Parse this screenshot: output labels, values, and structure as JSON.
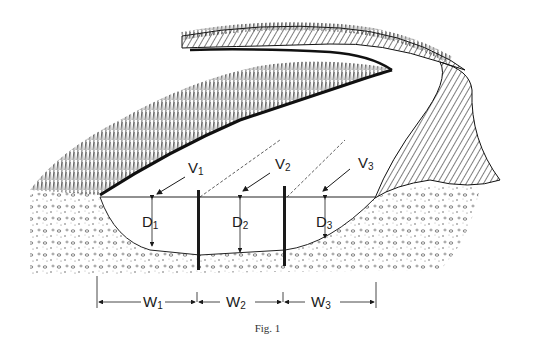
{
  "figure": {
    "caption": "Fig. 1",
    "velocity_labels": [
      {
        "main": "V",
        "sub": "1"
      },
      {
        "main": "V",
        "sub": "2"
      },
      {
        "main": "V",
        "sub": "3"
      }
    ],
    "depth_labels": [
      {
        "main": "D",
        "sub": "1"
      },
      {
        "main": "D",
        "sub": "2"
      },
      {
        "main": "D",
        "sub": "3"
      }
    ],
    "width_labels": [
      {
        "main": "W",
        "sub": "1"
      },
      {
        "main": "W",
        "sub": "2"
      },
      {
        "main": "W",
        "sub": "3"
      }
    ],
    "colors": {
      "ink": "#1a1a1a",
      "paper": "#ffffff"
    }
  }
}
